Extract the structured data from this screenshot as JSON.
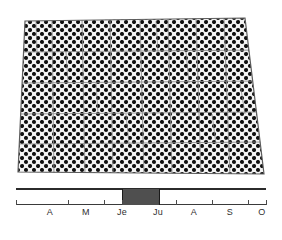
{
  "figure": {
    "name": "halftone-block-with-timeline",
    "background_color": "#ffffff",
    "ink_color": "#1a1a1a"
  },
  "block": {
    "name": "textured-trapezoid-block",
    "fill_pattern": "halftone-dot-screen",
    "dot_color": "#111111",
    "gap_color": "#f2f2f2",
    "dot_spacing_px": 8,
    "outline_color": "#707070",
    "corners": {
      "top_left": [
        25,
        21
      ],
      "top_right": [
        245,
        18
      ],
      "bottom_right": [
        264,
        174
      ],
      "bottom_left": [
        18,
        172
      ]
    },
    "cell_rows": 5,
    "cell_cols": 8
  },
  "timeline": {
    "name": "month-timeline",
    "axis_start_x": 16,
    "axis_end_x": 266,
    "highlight": {
      "label": "Ju",
      "start_x": 122,
      "end_x": 158,
      "color": "#4f4f4f"
    },
    "months": [
      {
        "label": "A",
        "full": "Avril",
        "center_x": 50
      },
      {
        "label": "M",
        "full": "Mai",
        "center_x": 86
      },
      {
        "label": "Je",
        "full": "Juin",
        "center_x": 122
      },
      {
        "label": "Ju",
        "full": "Juillet",
        "center_x": 158
      },
      {
        "label": "A",
        "full": "Aout",
        "center_x": 194
      },
      {
        "label": "S",
        "full": "Septembre",
        "center_x": 230
      },
      {
        "label": "O",
        "full": "Octobre",
        "center_x": 262
      }
    ],
    "ticks_x": [
      16,
      68,
      104,
      122,
      158,
      176,
      212,
      248,
      266
    ]
  },
  "chart_data": {
    "type": "bar",
    "title": "",
    "xlabel": "",
    "ylabel": "",
    "categories": [
      "A",
      "M",
      "Je",
      "Ju",
      "A",
      "S",
      "O"
    ],
    "category_full": [
      "Avril",
      "Mai",
      "Juin",
      "Juillet",
      "Aout",
      "Septembre",
      "Octobre"
    ],
    "values": [
      0,
      0,
      0,
      1,
      0,
      0,
      0
    ],
    "series": [
      {
        "name": "periode-mise-en-evidence",
        "values": [
          0,
          0,
          0,
          1,
          0,
          0,
          0
        ]
      }
    ],
    "grid": false,
    "legend": "none"
  }
}
